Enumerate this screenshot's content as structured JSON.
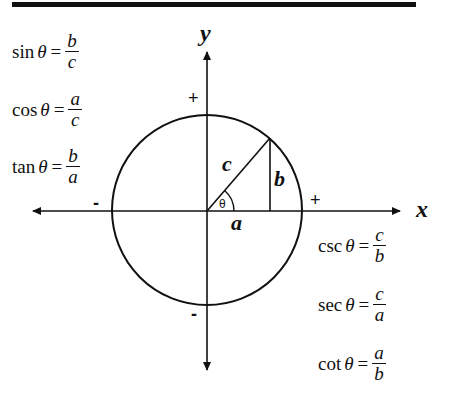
{
  "diagram": {
    "axes": {
      "x_label": "x",
      "y_label": "y"
    },
    "signs": {
      "y_positive": "+",
      "y_negative": "-",
      "x_positive": "+",
      "x_negative": "-"
    },
    "triangle": {
      "hypotenuse": "c",
      "opposite": "b",
      "adjacent": "a",
      "angle": "θ"
    },
    "formulas_left": [
      {
        "fn": "sin",
        "theta": "θ",
        "eq": "=",
        "num": "b",
        "den": "c"
      },
      {
        "fn": "cos",
        "theta": "θ",
        "eq": "=",
        "num": "a",
        "den": "c"
      },
      {
        "fn": "tan",
        "theta": "θ",
        "eq": "=",
        "num": "b",
        "den": "a"
      }
    ],
    "formulas_right": [
      {
        "fn": "csc",
        "theta": "θ",
        "eq": "=",
        "num": "c",
        "den": "b"
      },
      {
        "fn": "sec",
        "theta": "θ",
        "eq": "=",
        "num": "c",
        "den": "a"
      },
      {
        "fn": "cot",
        "theta": "θ",
        "eq": "=",
        "num": "a",
        "den": "b"
      }
    ],
    "colors": {
      "ink": "#111111",
      "background": "#ffffff"
    }
  }
}
